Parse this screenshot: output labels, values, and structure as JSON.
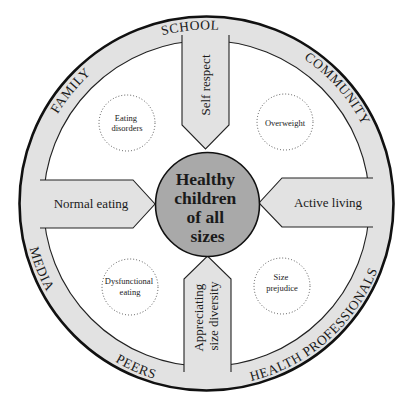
{
  "colors": {
    "ring_fill": "#e2e2e2",
    "center_fill": "#a9a9a9",
    "stroke": "#111111",
    "background": "#ffffff"
  },
  "center": {
    "lines": [
      "Healthy",
      "children",
      "of all",
      "sizes"
    ]
  },
  "arms": {
    "top": {
      "label": "Self respect"
    },
    "left": {
      "label": "Normal eating"
    },
    "right": {
      "label": "Active living"
    },
    "bottom": {
      "lines": [
        "Appreciating",
        "size diversity"
      ]
    }
  },
  "bubbles": {
    "top_left": {
      "lines": [
        "Eating",
        "disorders"
      ]
    },
    "top_right": {
      "lines": [
        "Overweight"
      ]
    },
    "bottom_left": {
      "lines": [
        "Dysfunctional",
        "eating"
      ]
    },
    "bottom_right": {
      "lines": [
        "Size",
        "prejudice"
      ]
    }
  },
  "ring_labels": {
    "school": "SCHOOL",
    "community": "COMMUNITY",
    "family": "FAMILY",
    "media": "MEDIA",
    "peers": "PEERS",
    "health_professionals": "HEALTH PROFESSIONALS"
  }
}
